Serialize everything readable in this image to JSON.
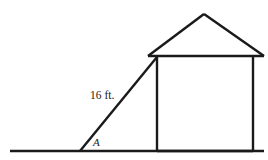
{
  "figure": {
    "type": "geometry-diagram",
    "background_color": "#ffffff",
    "stroke_color": "#1a1a1a",
    "labels": {
      "ladder_length": "16 ft.",
      "angle": "A"
    },
    "elements": {
      "ground_line": "ground-line",
      "ladder_line": "ladder-line",
      "house_left_wall": "house-left-wall",
      "house_right_wall": "house-right-wall",
      "house_base": "house-base",
      "roof_eave": "roof-eave",
      "roof_left_slope": "roof-left-slope",
      "roof_right_slope": "roof-right-slope"
    },
    "geometry": {
      "ground_start_x": 10,
      "ground_end_x": 264,
      "ground_y": 151,
      "ladder_foot_x": 80,
      "ladder_foot_y": 151,
      "ladder_top_x": 157,
      "ladder_top_y": 57,
      "wall_left_x": 157,
      "wall_right_x": 253,
      "wall_top_y": 57,
      "wall_bottom_y": 151,
      "eave_left_x": 148,
      "eave_right_x": 264,
      "eave_y": 56,
      "apex_x": 204,
      "apex_y": 14,
      "length_label_x": 90,
      "length_label_y": 99,
      "angle_label_x": 93,
      "angle_label_y": 146
    }
  }
}
